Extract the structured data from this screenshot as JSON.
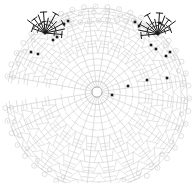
{
  "document": {
    "type": "crochet-stitch-chart",
    "title": "Crochet Pattern Chart",
    "description": "Radial crochet stitch diagram forming a fan / semicircular doily worked in rounds from a central magic ring",
    "background_color": "#ffffff",
    "canvas": {
      "width": 195,
      "height": 183
    }
  },
  "chart_data": {
    "type": "diagram",
    "subtype": "radial-stitch-chart",
    "xlabel": "",
    "ylabel": "",
    "center": {
      "x": 97,
      "y": 92
    },
    "grid": false,
    "legend_position": "none",
    "colors": {
      "stitch_light": "#c9c9c9",
      "stitch_mid": "#b4b4b4",
      "stitch_dark": "#1a1a1a",
      "background": "#ffffff"
    },
    "structure": {
      "rings_count": 9,
      "spokes_count": 24,
      "ring_radii": [
        6,
        17,
        29,
        42,
        55,
        66,
        76,
        84,
        90
      ],
      "fan_start_angle_deg": -170,
      "fan_sweep_deg": 340
    },
    "highlight_motifs": [
      {
        "name": "starburst-left",
        "center": {
          "x": 45,
          "y": 33
        },
        "ray_count": 11,
        "ray_length": 22,
        "color": "#1a1a1a",
        "dot_count": 6
      },
      {
        "name": "starburst-right",
        "center": {
          "x": 158,
          "y": 34
        },
        "ray_count": 11,
        "ray_length": 22,
        "color": "#1a1a1a",
        "dot_count": 6
      }
    ],
    "marker_dots": [
      {
        "x": 64,
        "y": 24
      },
      {
        "x": 68,
        "y": 21
      },
      {
        "x": 53,
        "y": 40
      },
      {
        "x": 57,
        "y": 37
      },
      {
        "x": 31,
        "y": 52
      },
      {
        "x": 38,
        "y": 54
      },
      {
        "x": 135,
        "y": 22
      },
      {
        "x": 139,
        "y": 26
      },
      {
        "x": 151,
        "y": 45
      },
      {
        "x": 156,
        "y": 49
      },
      {
        "x": 166,
        "y": 56
      },
      {
        "x": 170,
        "y": 52
      },
      {
        "x": 112,
        "y": 95
      },
      {
        "x": 128,
        "y": 86
      },
      {
        "x": 147,
        "y": 80
      },
      {
        "x": 167,
        "y": 78
      },
      {
        "x": 160,
        "y": 23
      }
    ],
    "series": [
      {
        "name": "light-stitches",
        "color": "#c9c9c9",
        "description": "main body of chart, treble / double-crochet symbols in rounds"
      },
      {
        "name": "dark-highlight",
        "color": "#1a1a1a",
        "description": "two emphasized starburst motifs and scattered stitch markers"
      }
    ]
  }
}
